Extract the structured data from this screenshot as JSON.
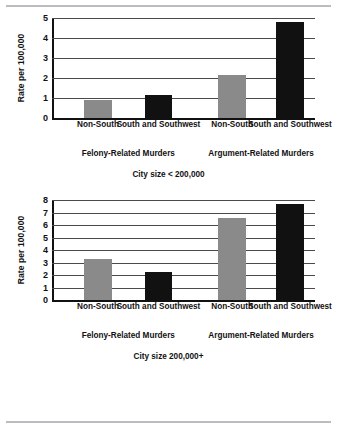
{
  "figure": {
    "y_axis_title": "Rate per 100,000",
    "series_names": [
      "Non-South",
      "South and Southwest"
    ],
    "group_names": [
      "Felony-Related Murders",
      "Argument-Related Murders"
    ]
  },
  "chart_data": [
    {
      "type": "bar",
      "title": "City size < 200,000",
      "xlabel": "",
      "ylabel": "Rate per 100,000",
      "ylim": [
        0,
        5
      ],
      "yticks": [
        0,
        1,
        2,
        3,
        4,
        5
      ],
      "grid": true,
      "legend": "none",
      "groups": [
        "Felony-Related Murders",
        "Argument-Related Murders"
      ],
      "categories": [
        "Non-South",
        "South and Southwest",
        "Non-South",
        "South and Southwest"
      ],
      "series": [
        {
          "name": "Non-South",
          "color": "#8a8a8a",
          "values": [
            0.9,
            2.15
          ]
        },
        {
          "name": "South and Southwest",
          "color": "#111111",
          "values": [
            1.15,
            4.8
          ]
        }
      ],
      "bars": [
        {
          "group": "Felony-Related Murders",
          "category": "Non-South",
          "value": 0.9,
          "color": "#8a8a8a"
        },
        {
          "group": "Felony-Related Murders",
          "category": "South and Southwest",
          "value": 1.15,
          "color": "#111111"
        },
        {
          "group": "Argument-Related Murders",
          "category": "Non-South",
          "value": 2.15,
          "color": "#8a8a8a"
        },
        {
          "group": "Argument-Related Murders",
          "category": "South and Southwest",
          "value": 4.8,
          "color": "#111111"
        }
      ]
    },
    {
      "type": "bar",
      "title": "City size 200,000+",
      "xlabel": "",
      "ylabel": "Rate per 100,000",
      "ylim": [
        0,
        8
      ],
      "yticks": [
        0,
        1,
        2,
        3,
        4,
        5,
        6,
        7,
        8
      ],
      "grid": true,
      "legend": "none",
      "groups": [
        "Felony-Related Murders",
        "Argument-Related Murders"
      ],
      "categories": [
        "Non-South",
        "South and Southwest",
        "Non-South",
        "South and Southwest"
      ],
      "series": [
        {
          "name": "Non-South",
          "color": "#8a8a8a",
          "values": [
            3.25,
            6.6
          ]
        },
        {
          "name": "South and Southwest",
          "color": "#111111",
          "values": [
            2.25,
            7.7
          ]
        }
      ],
      "bars": [
        {
          "group": "Felony-Related Murders",
          "category": "Non-South",
          "value": 3.25,
          "color": "#8a8a8a"
        },
        {
          "group": "Felony-Related Murders",
          "category": "South and Southwest",
          "value": 2.25,
          "color": "#111111"
        },
        {
          "group": "Argument-Related Murders",
          "category": "Non-South",
          "value": 6.6,
          "color": "#8a8a8a"
        },
        {
          "group": "Argument-Related Murders",
          "category": "South and Southwest",
          "value": 7.7,
          "color": "#111111"
        }
      ]
    }
  ]
}
